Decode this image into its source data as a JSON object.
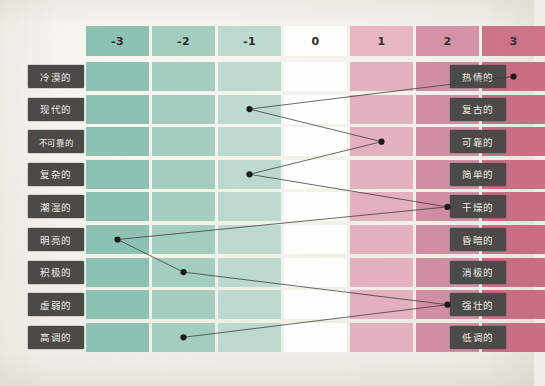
{
  "scale": {
    "header_labels": [
      "-3",
      "-2",
      "-1",
      "0",
      "1",
      "2",
      "3"
    ],
    "values": [
      -3,
      -2,
      -1,
      0,
      1,
      2,
      3
    ],
    "column_colors": [
      "#8ec3b4",
      "#a3cec0",
      "#bddbd0",
      "#ffffff",
      "#e8b8c3",
      "#d593a6",
      "#cc7389"
    ],
    "row_column_colors": [
      "#8ec3b4",
      "#a3cec0",
      "#bddbd0",
      "#ffffff",
      "#e5b2bf",
      "#d18fa3",
      "#c96f86"
    ]
  },
  "style": {
    "label_background": "#4b4a47",
    "label_text_color": "#f2f0ea",
    "paper_background": "#efeee9",
    "line_color": "#3a3a38",
    "dot_color": "#1b1b1a"
  },
  "rows": [
    {
      "left": "冷漠的",
      "right": "热情的",
      "value": 3
    },
    {
      "left": "现代的",
      "right": "复古的",
      "value": -1
    },
    {
      "left": "不可靠的",
      "right": "可靠的",
      "value": 1
    },
    {
      "left": "复杂的",
      "right": "简单的",
      "value": -1
    },
    {
      "left": "潮湿的",
      "right": "干燥的",
      "value": 2
    },
    {
      "left": "明亮的",
      "right": "昏暗的",
      "value": -3
    },
    {
      "left": "积极的",
      "right": "消极的",
      "value": -2
    },
    {
      "left": "虚弱的",
      "right": "强壮的",
      "value": 2
    },
    {
      "left": "高调的",
      "right": "低调的",
      "value": -2
    }
  ],
  "chart_data": {
    "type": "line",
    "orientation": "horizontal-rows",
    "xlabel": "",
    "ylabel": "",
    "x": [
      -3,
      -2,
      -1,
      0,
      1,
      2,
      3
    ],
    "xtick_labels": [
      "-3",
      "-2",
      "-1",
      "0",
      "1",
      "2",
      "3"
    ],
    "xlim": [
      -3,
      3
    ],
    "grid": false,
    "legend": "none",
    "categories": [
      "冷漠的 — 热情的",
      "现代的 — 复古的",
      "不可靠的 — 可靠的",
      "复杂的 — 简单的",
      "潮湿的 — 干燥的",
      "明亮的 — 昏暗的",
      "积极的 — 消极的",
      "虚弱的 — 强壮的",
      "高调的 — 低调的"
    ],
    "values": [
      3,
      -1,
      1,
      -1,
      2,
      -3,
      -2,
      2,
      -2
    ],
    "series": [
      {
        "name": "rating",
        "values": [
          3,
          -1,
          1,
          -1,
          2,
          -3,
          -2,
          2,
          -2
        ]
      }
    ]
  }
}
